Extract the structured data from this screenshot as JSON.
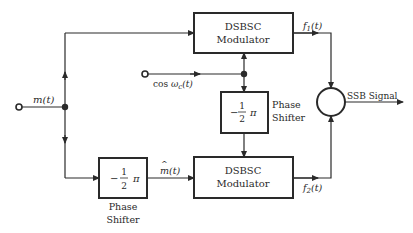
{
  "diagram": {
    "colors": {
      "line": "#2a2a2a",
      "background": "#ffffff"
    },
    "inputs": {
      "message": {
        "label": "m(t)"
      },
      "carrier": {
        "label_prefix": "cos ",
        "label_var": "ω",
        "label_sub": "c",
        "label_suffix": "(t)"
      }
    },
    "blocks": {
      "top_modulator": {
        "line1": "DSBSC",
        "line2": "Modulator"
      },
      "bottom_modulator": {
        "line1": "DSBSC",
        "line2": "Modulator"
      },
      "carrier_shifter": {
        "minus": "−",
        "num": "1",
        "den": "2",
        "pi": "π",
        "caption1": "Phase",
        "caption2": "Shifter"
      },
      "message_shifter": {
        "minus": "−",
        "num": "1",
        "den": "2",
        "pi": "π",
        "caption1": "Phase",
        "caption2": "Shifter"
      }
    },
    "signals": {
      "mhat": {
        "label": "m(t)",
        "hat": "^"
      },
      "f1": {
        "base": "f",
        "sub": "1",
        "suffix": "(t)"
      },
      "f2": {
        "base": "f",
        "sub": "2",
        "suffix": "(t)"
      },
      "output": {
        "label": "SSB Signal"
      }
    }
  }
}
